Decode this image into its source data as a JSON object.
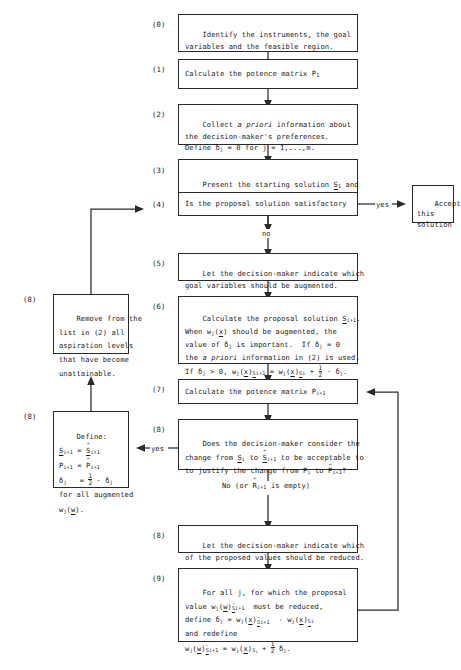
{
  "diagram": {
    "edge_labels": {
      "yes_accept": "yes",
      "no_from_4": "no",
      "yes_from_8": "yes",
      "no_from_8": "No (or R̂ᵢ₊₁ is empty)"
    },
    "accept_box": "Accept\nthis\nsolution",
    "steps": [
      {
        "id": "s0",
        "number": "(0)",
        "text": "Identify the instruments, the goal\nvariables and the feasible region."
      },
      {
        "id": "s1",
        "number": "(1)",
        "text": "Calculate the potence matrix P₁"
      },
      {
        "id": "s2",
        "number": "(2)",
        "text": "Collect a priori information about\nthe decision-maker's preferences.\nDefine δⱼ = 0 for j = 1,...,m."
      },
      {
        "id": "s3",
        "number": "(3)",
        "text": "Present the starting solution S₁ and\nthe potence matrix P₁ to the decision-\nmaker."
      },
      {
        "id": "s4",
        "number": "(4)",
        "text": "Is the proposal solution satisfactory"
      },
      {
        "id": "s5",
        "number": "(5)",
        "text": "Let the decision-maker indicate which\ngoal variables should be augmented."
      },
      {
        "id": "s6",
        "number": "(6)",
        "text": "Calculate the proposal solution Sᵢ₊₁.\nWhen wⱼ(x) should be augmented, the\nvalue of δⱼ is important.  If δⱼ = 0\nthe a priori information in (2) is used.\nIf δⱼ > 0, wⱼ(x)ₛᵢ₊₁ = wⱼ(x)ₛᵢ + ½ · δⱼ."
      },
      {
        "id": "s7",
        "number": "(7)",
        "text": "Calculate the potence matrix Pᵢ₊₁"
      },
      {
        "id": "s8",
        "number": "(8)",
        "text": "Does the decision-maker consider the\nchange from Sᵢ to Ŝᵢ₊₁ to be acceptable to\nto justify the change from Pᵢ to P̂ᵢ₊₁?"
      },
      {
        "id": "s8left_remove",
        "number": "(8)",
        "text": "Remove from the\nlist in (2) all\naspiration levels\nthat have become\nunattainable."
      },
      {
        "id": "s8left_define",
        "number": "(8)",
        "text": "Define:\nSᵢ₊₁ = Ŝᵢ₊₁\nPᵢ₊₁ = P̂ᵢ₊₁\nδⱼ    = ½ · δⱼ\nfor all augmented\nwⱼ(w)."
      },
      {
        "id": "s8reduce",
        "number": "(8)",
        "text": "Let the decision-maker indicate which\nof the proposed values should be reduced."
      },
      {
        "id": "s9",
        "number": "(9)",
        "text": "For all j, for which the proposal\nvalue wⱼ(w)̂ₛᵢ₊₁ must be reduced,\ndefine δⱼ = wⱼ(x)̂ₛᵢ₊₁ - wⱼ(x)ₛᵢ\nand redefine\nwⱼ(w)̂ₛᵢ₊₁ = wⱼ(x)ₛᵢ + ½ δⱼ."
      }
    ]
  }
}
